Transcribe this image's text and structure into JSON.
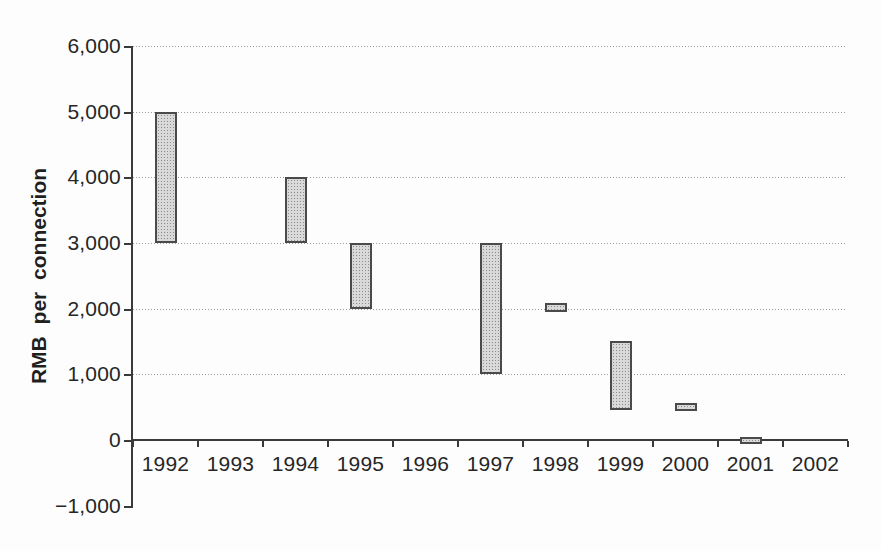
{
  "chart_data": {
    "type": "bar",
    "subtype": "floating-range-bars",
    "title": "",
    "xlabel": "",
    "ylabel": "RMB per connection",
    "legend_position": "none",
    "grid": "horizontal dotted gridlines at every 1,000 above zero",
    "categories": [
      "1992",
      "1993",
      "1994",
      "1995",
      "1996",
      "1997",
      "1998",
      "1999",
      "2000",
      "2001",
      "2002"
    ],
    "y_axis": {
      "min": -1000,
      "max": 6000,
      "step": 1000,
      "tick_labels": [
        "−1,000",
        "0",
        "1,000",
        "2,000",
        "3,000",
        "4,000",
        "5,000",
        "6,000"
      ]
    },
    "x_axis": {
      "tick_labels": [
        "1992",
        "1993",
        "1994",
        "1995",
        "1996",
        "1997",
        "1998",
        "1999",
        "2000",
        "2001",
        "2002"
      ]
    },
    "series": [
      {
        "name": "connection-fee-range",
        "ranges": [
          {
            "category": "1992",
            "low": 3000,
            "high": 5000
          },
          {
            "category": "1993",
            "low": null,
            "high": null
          },
          {
            "category": "1994",
            "low": 3000,
            "high": 4000
          },
          {
            "category": "1995",
            "low": 2000,
            "high": 3000
          },
          {
            "category": "1996",
            "low": null,
            "high": null
          },
          {
            "category": "1997",
            "low": 1000,
            "high": 3000
          },
          {
            "category": "1998",
            "low": 1950,
            "high": 2080
          },
          {
            "category": "1999",
            "low": 450,
            "high": 1500
          },
          {
            "category": "2000",
            "low": 440,
            "high": 560
          },
          {
            "category": "2001",
            "low": -60,
            "high": 40
          },
          {
            "category": "2002",
            "low": null,
            "high": null
          }
        ]
      }
    ],
    "colors": {
      "bar_fill": "#d9d9d9",
      "bar_pattern_dot": "#8d8d8d",
      "bar_border": "#4a4a4a",
      "gridline": "#9b9b9b",
      "axis": "#3a3a3a",
      "text": "#262626",
      "background": "#fdfdfd"
    }
  }
}
